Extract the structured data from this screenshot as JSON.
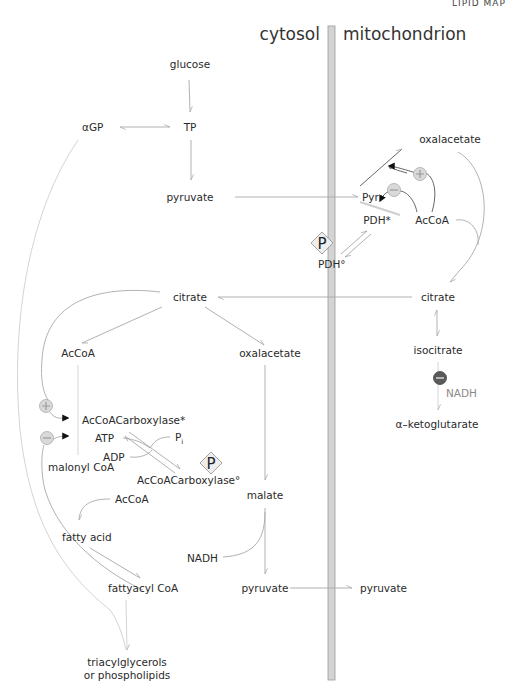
{
  "corner_title": "LIPID MAP",
  "compartments": {
    "left": "cytosol",
    "right": "mitochondrion"
  },
  "colors": {
    "membrane_fill": "#d4d4d4",
    "membrane_edge": "#9a9a9a",
    "line": "#a8a8a8",
    "inhibitor_dark": "#5a5a5a",
    "modifier_light": "#d9d9d9"
  },
  "metabolites": {
    "glucose": "glucose",
    "tp": "TP",
    "agp": "αGP",
    "pyruvate_cyto": "pyruvate",
    "pyr_mito": "Pyr",
    "oxalacetate_mito": "oxalacetate",
    "pdh_active": "PDH*",
    "acoa_mito": "AcCoA",
    "pdh_inactive": "PDH°",
    "citrate_cyto": "citrate",
    "citrate_mito": "citrate",
    "acoa_cyto": "AcCoA",
    "oxalacetate_cyto": "oxalacetate",
    "isocitrate": "isocitrate",
    "nadh_mito": "NADH",
    "akg": "α–ketoglutarate",
    "acc_active": "AcCoACarboxylase*",
    "atp": "ATP",
    "adp": "ADP",
    "pi": "P",
    "pi_sub": "i",
    "acc_inactive": "AcCoACarboxylase°",
    "malonyl": "malonyl CoA",
    "acoa_fa": "AcCoA",
    "fatty_acid": "fatty acid",
    "malate": "malate",
    "nadh_cyto": "NADH",
    "fattyacyl": "fattyacyl CoA",
    "pyruvate_cyto2": "pyruvate",
    "pyruvate_mito2": "pyruvate",
    "tag1": "triacylglycerols",
    "tag2": "or phospholipids"
  },
  "phospho_label": "P",
  "modifiers": [
    {
      "id": "plus-oxalacetate",
      "sign": "+",
      "target": "Pyr → oxalacetate",
      "source": "AcCoA"
    },
    {
      "id": "minus-pdh",
      "sign": "−",
      "target": "PDH*",
      "source": "AcCoA"
    },
    {
      "id": "plus-acc",
      "sign": "+",
      "target": "AcCoACarboxylase*",
      "source": "citrate"
    },
    {
      "id": "minus-acc",
      "sign": "−",
      "target": "AcCoACarboxylase*",
      "source": "fattyacyl CoA"
    },
    {
      "id": "minus-idh",
      "sign": "−",
      "target": "isocitrate → α-ketoglutarate",
      "source": "NADH"
    }
  ]
}
